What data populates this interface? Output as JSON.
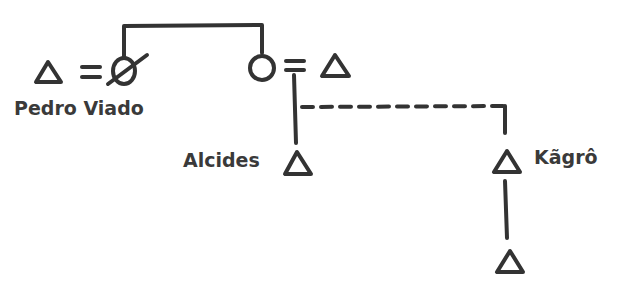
{
  "diagram": {
    "type": "kinship",
    "stroke_color": "#333333",
    "individuals": [
      {
        "id": "p1",
        "symbol": "male",
        "label": "",
        "note": "husband of deceased woman"
      },
      {
        "id": "p2",
        "symbol": "female-deceased",
        "label": ""
      },
      {
        "id": "p3",
        "symbol": "female",
        "label": ""
      },
      {
        "id": "p4",
        "symbol": "male",
        "label": ""
      },
      {
        "id": "p5",
        "symbol": "male",
        "label": "Alcides"
      },
      {
        "id": "p6",
        "symbol": "male",
        "label": "Kãgrô"
      },
      {
        "id": "p7",
        "symbol": "male",
        "label": ""
      }
    ],
    "relations": [
      {
        "type": "marriage",
        "from": "p1",
        "to": "p2"
      },
      {
        "type": "sibling",
        "from": "p2",
        "to": "p3"
      },
      {
        "type": "marriage",
        "from": "p3",
        "to": "p4"
      },
      {
        "type": "descent",
        "from": "p3-p4",
        "to": "p5"
      },
      {
        "type": "descent-dashed",
        "from": "p3-p4",
        "to": "p6"
      },
      {
        "type": "descent",
        "from": "p6",
        "to": "p7"
      }
    ],
    "labels": {
      "pedro": "Pedro Viado",
      "alcides": "Alcides",
      "kagro": "Kãgrô"
    }
  }
}
